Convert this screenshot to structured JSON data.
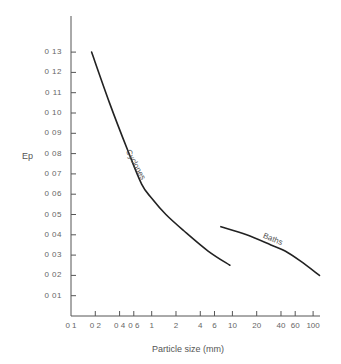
{
  "chart_data": {
    "type": "line",
    "title": "",
    "xlabel": "Particle size (mm)",
    "ylabel": "Ep",
    "xscale": "log",
    "xlim": [
      0.1,
      120
    ],
    "ylim": [
      0,
      0.14
    ],
    "grid": false,
    "yticks": [
      "0.01",
      "0.02",
      "0.03",
      "0.04",
      "0.05",
      "0.06",
      "0.07",
      "0.08",
      "0.09",
      "0.10",
      "0.11",
      "0.12",
      "0.13"
    ],
    "ytick_labels": [
      "0 01",
      "0 02",
      "0 03",
      "0 04",
      "0 05",
      "0 06",
      "0 07",
      "0 08",
      "0 09",
      "0 10",
      "0 11",
      "0 12",
      "0 13"
    ],
    "xticks": [
      0.1,
      0.2,
      0.4,
      0.6,
      1,
      2,
      4,
      6,
      10,
      20,
      40,
      60,
      100
    ],
    "xtick_labels": [
      "0 1",
      "0 2",
      "0 4",
      "0 6",
      "1",
      "2",
      "4",
      "6",
      "10",
      "20",
      "40",
      "60",
      "100"
    ],
    "series": [
      {
        "name": "Cyclones",
        "x": [
          0.18,
          0.3,
          0.5,
          0.75,
          1.0,
          1.5,
          2.5,
          5.0,
          9.3
        ],
        "y": [
          0.13,
          0.105,
          0.082,
          0.065,
          0.058,
          0.05,
          0.042,
          0.032,
          0.025
        ]
      },
      {
        "name": "Baths",
        "x": [
          7.2,
          15,
          30,
          45,
          70,
          120
        ],
        "y": [
          0.044,
          0.04,
          0.035,
          0.032,
          0.027,
          0.02
        ]
      }
    ],
    "annotations": [
      "Cyclones",
      "Baths"
    ]
  },
  "labels": {
    "ylabel": "Ep",
    "xlabel": "Particle size (mm)",
    "cyclones": "Cyclones",
    "baths": "Baths"
  }
}
